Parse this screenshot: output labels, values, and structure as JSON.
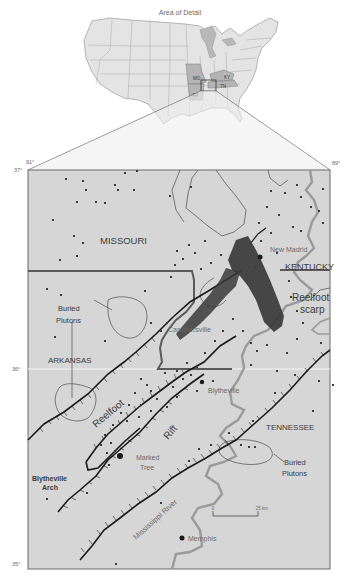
{
  "inset": {
    "title": "Area of Detail",
    "state_labels": [
      "MO",
      "KY",
      "AR",
      "TN"
    ]
  },
  "coords": {
    "lon_west": "91°",
    "lon_east": "89°",
    "lat_north": "37°",
    "lat_mid": "36°",
    "lat_south": "35°"
  },
  "labels": {
    "missouri": "MISSOURI",
    "kentucky": "KENTUCKY",
    "arkansas": "ARKANSAS",
    "tennessee": "TENNESSEE",
    "new_madrid": "New Madrid",
    "caruthersville": "Caruthersville",
    "blytheville": "Blytheville",
    "marked_tree_1": "Marked",
    "marked_tree_2": "Tree",
    "memphis": "Memphis",
    "reelfoot_scarp_1": "Reelfoot",
    "reelfoot_scarp_2": "scarp",
    "reelfoot_rift_1": "Reelfoot",
    "reelfoot_rift_2": "Rift",
    "buried_plutons_w_1": "Buried",
    "buried_plutons_w_2": "Plutons",
    "buried_plutons_e_1": "Buried",
    "buried_plutons_e_2": "Plutons",
    "blytheville_arch_1": "Blytheville",
    "blytheville_arch_2": "Arch",
    "mississippi_river": "Mississippi River"
  },
  "scale": {
    "start": "0",
    "end": "25 km"
  },
  "colors": {
    "map_bg": "#d6d6d6",
    "inset_land": "#e4e4e4",
    "inset_highlight": "#b4b4b4",
    "river": "#9a9a9a",
    "border": "#5a5a5a",
    "fault": "#1a1a1a",
    "quake": "#3a3a3a"
  }
}
